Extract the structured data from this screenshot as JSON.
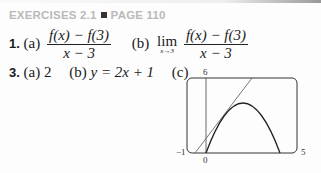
{
  "header": {
    "section": "EXERCISES 2.1",
    "page": "PAGE 110"
  },
  "exercise1": {
    "number": "1.",
    "a_label": "(a)",
    "a_numerator": "f(x) − f(3)",
    "a_denominator": "x − 3",
    "b_label": "(b)",
    "lim": "lim",
    "lim_sub": "x→3",
    "b_numerator": "f(x) − f(3)",
    "b_denominator": "x − 3"
  },
  "exercise3": {
    "number": "3.",
    "a_label": "(a)",
    "a_value": "2",
    "b_label": "(b)",
    "b_value": "y = 2x + 1",
    "c_label": "(c)"
  },
  "graph": {
    "xmin_label": "−1",
    "xmax_label": "5",
    "ymax_label": "6",
    "origin_label": "0",
    "colors": {
      "frame": "#333333",
      "curve": "#222222",
      "tangent": "#555555"
    }
  }
}
